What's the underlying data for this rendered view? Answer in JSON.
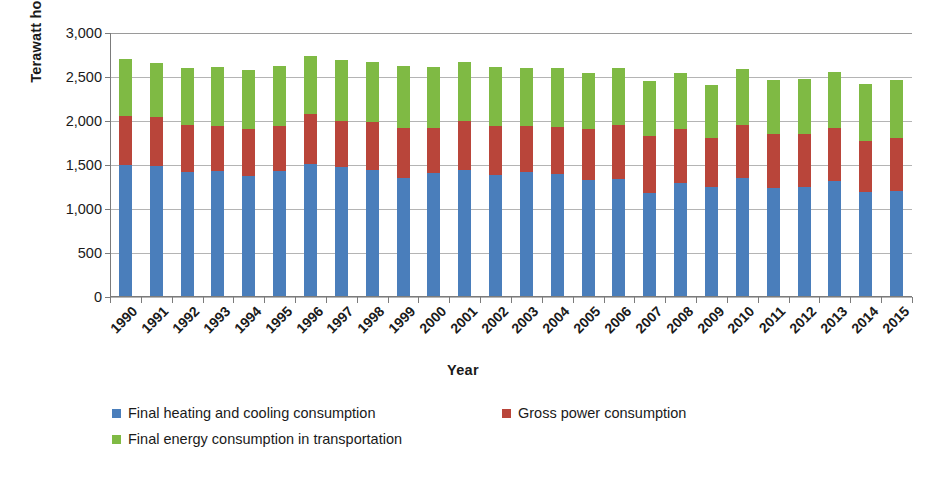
{
  "chart_data": {
    "type": "bar",
    "subtype": "stacked-column",
    "title": "",
    "xlabel": "Year",
    "ylabel": "Terawatt hours",
    "ylim": [
      0,
      3000
    ],
    "y_ticks": [
      0,
      500,
      1000,
      1500,
      2000,
      2500,
      3000
    ],
    "y_tick_labels": [
      "0",
      "500",
      "1,000",
      "1,500",
      "2,000",
      "2,500",
      "3,000"
    ],
    "grid": true,
    "grid_axis": "y",
    "legend_position": "bottom-left",
    "categories": [
      "1990",
      "1991",
      "1992",
      "1993",
      "1994",
      "1995",
      "1996",
      "1997",
      "1998",
      "1999",
      "2000",
      "2001",
      "2002",
      "2003",
      "2004",
      "2005",
      "2006",
      "2007",
      "2008",
      "2009",
      "2010",
      "2011",
      "2012",
      "2013",
      "2014",
      "2015"
    ],
    "series": [
      {
        "name": "Final heating and cooling consumption",
        "color": "#4a7ebb",
        "values": [
          1505,
          1490,
          1420,
          1430,
          1370,
          1430,
          1515,
          1475,
          1440,
          1350,
          1410,
          1445,
          1390,
          1420,
          1400,
          1330,
          1345,
          1180,
          1295,
          1250,
          1350,
          1240,
          1255,
          1320,
          1190,
          1205
        ]
      },
      {
        "name": "Gross power consumption",
        "color": "#b9453a",
        "values": [
          555,
          555,
          530,
          510,
          545,
          510,
          560,
          520,
          545,
          565,
          505,
          560,
          550,
          520,
          535,
          580,
          605,
          650,
          620,
          555,
          610,
          610,
          600,
          605,
          585,
          600
        ]
      },
      {
        "name": "Final energy consumption in transportation",
        "color": "#7fba44",
        "values": [
          640,
          620,
          650,
          670,
          665,
          690,
          665,
          700,
          690,
          710,
          695,
          665,
          670,
          665,
          670,
          635,
          650,
          625,
          635,
          600,
          635,
          615,
          620,
          630,
          650,
          665
        ]
      }
    ]
  },
  "axes": {
    "y_title": "Terawatt hours",
    "x_title": "Year"
  }
}
